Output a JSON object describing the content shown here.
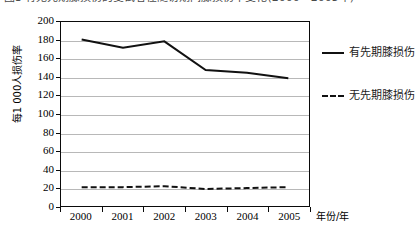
{
  "caption": {
    "text": "图3 有无先期膝损伤的受试者在随访期间膝损伤率变化(2000—2005年)"
  },
  "chart_data": {
    "type": "line",
    "title": "",
    "xlabel": "年份/年",
    "ylabel": "每1 000人损伤率",
    "categories": [
      "2000",
      "2001",
      "2002",
      "2003",
      "2004",
      "2005"
    ],
    "x": [
      2000,
      2001,
      2002,
      2003,
      2004,
      2005
    ],
    "ylim": [
      0,
      200
    ],
    "ytick_step": 20,
    "yticks": [
      0,
      20,
      40,
      60,
      80,
      100,
      120,
      140,
      160,
      180,
      200
    ],
    "grid": "horizontal",
    "legend_position": "right",
    "series": [
      {
        "name": "有先期膝损伤",
        "style": "solid",
        "color": "#111111",
        "values": [
          181,
          172,
          179,
          148,
          145,
          139
        ]
      },
      {
        "name": "无先期膝损伤",
        "style": "dashed",
        "color": "#111111",
        "values": [
          21,
          21,
          22,
          19,
          20,
          21
        ]
      }
    ]
  },
  "colors": {
    "axis": "#0a0a0a",
    "grid": "#b8b8b8",
    "series": "#111111",
    "background": "#ffffff"
  }
}
